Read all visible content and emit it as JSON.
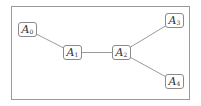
{
  "diagram": {
    "type": "graph",
    "nodes": [
      {
        "id": "A0",
        "base": "A",
        "sub": "0"
      },
      {
        "id": "A1",
        "base": "A",
        "sub": "1"
      },
      {
        "id": "A2",
        "base": "A",
        "sub": "2"
      },
      {
        "id": "A3",
        "base": "A",
        "sub": "3"
      },
      {
        "id": "A4",
        "base": "A",
        "sub": "4"
      }
    ],
    "edges": [
      {
        "from": "A0",
        "to": "A1"
      },
      {
        "from": "A1",
        "to": "A2"
      },
      {
        "from": "A2",
        "to": "A3"
      },
      {
        "from": "A2",
        "to": "A4"
      }
    ],
    "colors": {
      "edge": "#9a9a9a",
      "border": "#8a8a8a",
      "text": "#333333"
    }
  }
}
